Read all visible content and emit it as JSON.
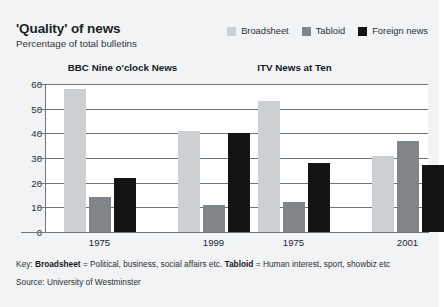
{
  "title": "'Quality' of news",
  "subtitle": "Percentage of total bulletins",
  "legend": [
    {
      "label": "Broadsheet",
      "color": "#ccd0d2",
      "name": "legend-swatch-broadsheet"
    },
    {
      "label": "Tabloid",
      "color": "#808589",
      "name": "legend-swatch-tabloid"
    },
    {
      "label": "Foreign news",
      "color": "#141414",
      "name": "legend-swatch-foreign-news"
    }
  ],
  "footer": {
    "key_prefix": "Key: ",
    "key_broadsheet_term": "Broadsheet",
    "key_broadsheet_def": " = Political, business, social affairs etc. ",
    "key_tabloid_term": "Tabloid",
    "key_tabloid_def": " = Human interest, sport, showbiz etc",
    "source": "Source: University of Westminster"
  },
  "chart_data": {
    "type": "bar",
    "title": "'Quality' of news",
    "subtitle": "Percentage of total bulletins",
    "xlabel": "",
    "ylabel": "Percentage of total bulletins",
    "ylim": [
      0,
      60
    ],
    "yticks": [
      0,
      10,
      20,
      30,
      40,
      50,
      60
    ],
    "grid": true,
    "legend_position": "top-right",
    "panels": [
      {
        "name": "BBC Nine o'clock News",
        "categories": [
          "1975",
          "1999"
        ],
        "series": [
          {
            "name": "Broadsheet",
            "color": "#ccd0d2",
            "values": [
              58,
              41
            ]
          },
          {
            "name": "Tabloid",
            "color": "#808589",
            "values": [
              14,
              11
            ]
          },
          {
            "name": "Foreign news",
            "color": "#141414",
            "values": [
              22,
              40
            ]
          }
        ]
      },
      {
        "name": "ITV News at Ten",
        "categories": [
          "1975",
          "2001"
        ],
        "series": [
          {
            "name": "Broadsheet",
            "color": "#ccd0d2",
            "values": [
              53,
              31
            ]
          },
          {
            "name": "Tabloid",
            "color": "#808589",
            "values": [
              12,
              37
            ]
          },
          {
            "name": "Foreign news",
            "color": "#141414",
            "values": [
              28,
              27
            ]
          }
        ]
      }
    ],
    "notes": [
      "Key: Broadsheet = Political, business, social affairs etc. Tabloid = Human interest, sport, showbiz etc",
      "Source: University of Westminster"
    ]
  }
}
